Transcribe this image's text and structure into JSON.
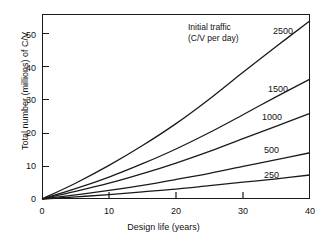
{
  "chart_data": {
    "type": "line",
    "title": "",
    "xlabel": "Design life (years)",
    "ylabel": "Total number (millions) of C/V",
    "xlim": [
      0,
      40
    ],
    "ylim": [
      0,
      54
    ],
    "xticks": [
      0,
      10,
      20,
      30,
      40
    ],
    "yticks": [
      0,
      10,
      20,
      30,
      40,
      50
    ],
    "xtick_labels": [
      "0",
      "10",
      "20",
      "30",
      "40"
    ],
    "ytick_labels": [
      "0",
      "10",
      "20",
      "30",
      "40",
      "50"
    ],
    "grid": false,
    "legend_position": "inline-right-of-curves",
    "legend_title_line1": "Initial traffic",
    "legend_title_line2": "(C/V per day)",
    "x": [
      0,
      5,
      10,
      15,
      20,
      25,
      30,
      35,
      40
    ],
    "series": [
      {
        "name": "2500",
        "label": "2500",
        "values": [
          0,
          4.6,
          9.8,
          15.6,
          22.0,
          29.2,
          37.0,
          44.6,
          52.0
        ]
      },
      {
        "name": "1500",
        "label": "1500",
        "values": [
          0,
          3.0,
          6.4,
          10.3,
          14.6,
          19.4,
          24.6,
          29.9,
          35.0
        ]
      },
      {
        "name": "1000",
        "label": "1000",
        "values": [
          0,
          2.2,
          4.6,
          7.4,
          10.5,
          13.9,
          17.6,
          21.3,
          25.0
        ]
      },
      {
        "name": "500",
        "label": "500",
        "values": [
          0,
          1.2,
          2.5,
          4.0,
          5.7,
          7.5,
          9.5,
          11.5,
          13.5
        ]
      },
      {
        "name": "250",
        "label": "250",
        "values": [
          0,
          0.6,
          1.3,
          2.1,
          2.9,
          3.9,
          4.9,
          5.9,
          7.0
        ]
      }
    ]
  },
  "axes": {
    "x_title": "Design life (years)",
    "y_title": "Total number (millions) of C/V"
  },
  "legend": {
    "title_line1": "Initial traffic",
    "title_line2": "(C/V per day)"
  },
  "style": {
    "line_color": "#1a1a1a",
    "axis_color": "#1a1a1a",
    "background": "#ffffff",
    "text_color": "#111111"
  }
}
